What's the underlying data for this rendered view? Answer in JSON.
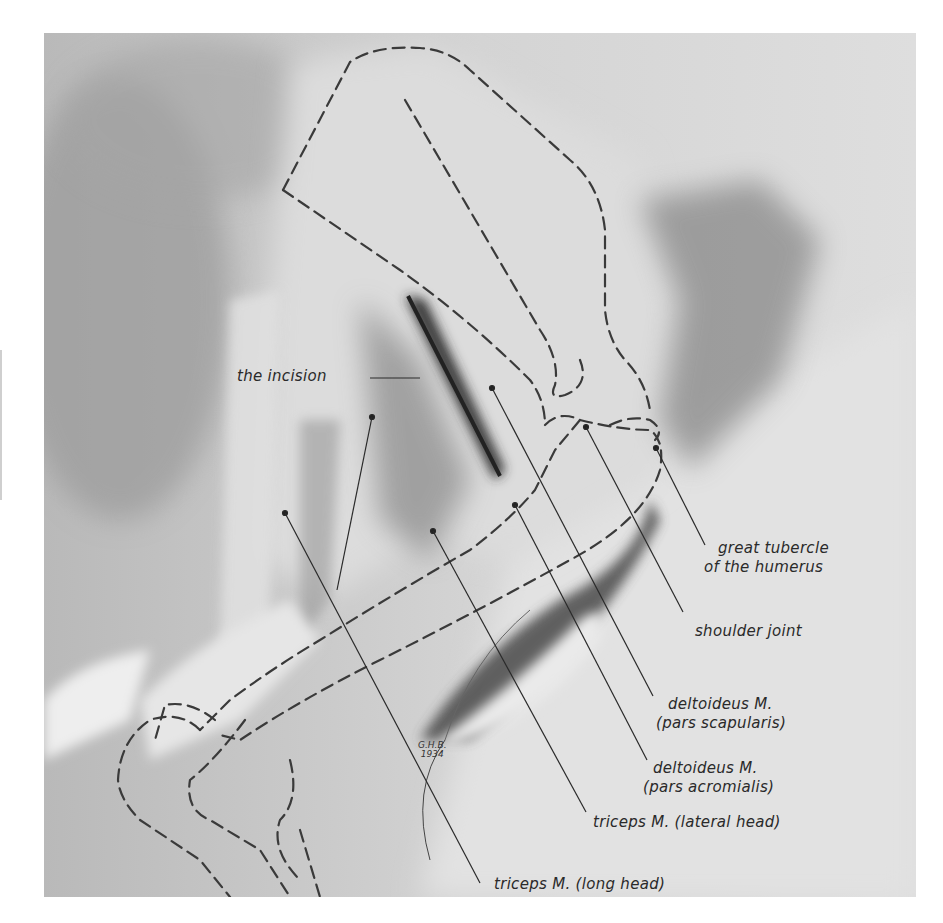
{
  "figure": {
    "type": "anatomical illustration",
    "colors": {
      "background": "#ffffff",
      "plate": "#d9d9d9",
      "ink": "#2a2a2a",
      "dashed_outline": "#3a3a3a",
      "shadow": "#5a5a5a"
    }
  },
  "labels": {
    "incision": "the incision",
    "great_tubercle": [
      "great tubercle",
      "of the humerus"
    ],
    "shoulder_joint": "shoulder joint",
    "deltoid_scapular": [
      "deltoideus M.",
      "(pars scapularis)"
    ],
    "deltoid_acromial": [
      "deltoideus M.",
      "(pars acromialis)"
    ],
    "triceps_lateral": "triceps M. (lateral head)",
    "triceps_long": "triceps M. (long head)"
  },
  "signature": [
    "G.H.B.",
    "1934"
  ]
}
